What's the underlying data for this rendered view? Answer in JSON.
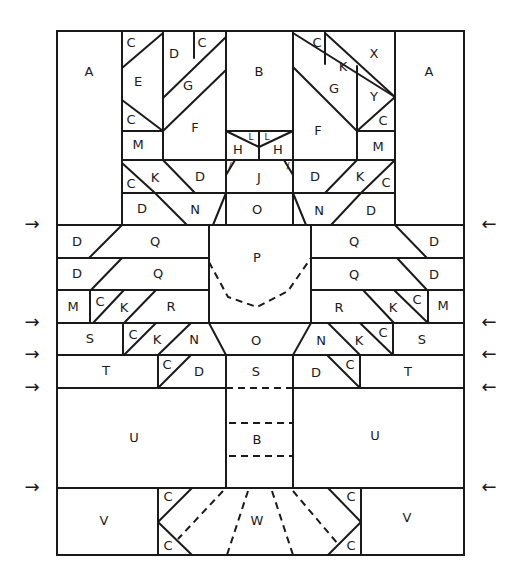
{
  "diagram": {
    "type": "quilt-block-piecing-diagram",
    "stroke_color": "#1a1a1a",
    "background": "#ffffff",
    "labels": [
      {
        "id": "A-left",
        "text": "A",
        "x": 89,
        "y": 72
      },
      {
        "id": "A-right",
        "text": "A",
        "x": 429,
        "y": 72
      },
      {
        "id": "B-top",
        "text": "B",
        "x": 259,
        "y": 72
      },
      {
        "id": "C1",
        "text": "C",
        "x": 131,
        "y": 43
      },
      {
        "id": "D1",
        "text": "D",
        "x": 174,
        "y": 54
      },
      {
        "id": "C2",
        "text": "C",
        "x": 202,
        "y": 43
      },
      {
        "id": "E",
        "text": "E",
        "x": 138,
        "y": 82
      },
      {
        "id": "G-left",
        "text": "G",
        "x": 188,
        "y": 86
      },
      {
        "id": "C3",
        "text": "C",
        "x": 131,
        "y": 120
      },
      {
        "id": "F-left",
        "text": "F",
        "x": 195,
        "y": 128
      },
      {
        "id": "M-left-top",
        "text": "M",
        "x": 138,
        "y": 145
      },
      {
        "id": "C4",
        "text": "C",
        "x": 131,
        "y": 184
      },
      {
        "id": "K1",
        "text": "K",
        "x": 155,
        "y": 178
      },
      {
        "id": "D2",
        "text": "D",
        "x": 200,
        "y": 177
      },
      {
        "id": "D3",
        "text": "D",
        "x": 142,
        "y": 209
      },
      {
        "id": "N1",
        "text": "N",
        "x": 195,
        "y": 210
      },
      {
        "id": "C5",
        "text": "C",
        "x": 317,
        "y": 43
      },
      {
        "id": "X",
        "text": "X",
        "x": 374,
        "y": 54
      },
      {
        "id": "K2",
        "text": "K",
        "x": 343,
        "y": 67
      },
      {
        "id": "G-right",
        "text": "G",
        "x": 334,
        "y": 89
      },
      {
        "id": "Y",
        "text": "Y",
        "x": 374,
        "y": 97
      },
      {
        "id": "C6",
        "text": "C",
        "x": 383,
        "y": 121
      },
      {
        "id": "F-right",
        "text": "F",
        "x": 318,
        "y": 131
      },
      {
        "id": "M-right-top",
        "text": "M",
        "x": 378,
        "y": 147
      },
      {
        "id": "D4",
        "text": "D",
        "x": 315,
        "y": 177
      },
      {
        "id": "K3",
        "text": "K",
        "x": 360,
        "y": 177
      },
      {
        "id": "C7",
        "text": "C",
        "x": 386,
        "y": 183
      },
      {
        "id": "N2",
        "text": "N",
        "x": 319,
        "y": 211
      },
      {
        "id": "D5",
        "text": "D",
        "x": 371,
        "y": 211
      },
      {
        "id": "H-left",
        "text": "H",
        "x": 238,
        "y": 150
      },
      {
        "id": "H-right",
        "text": "H",
        "x": 278,
        "y": 150
      },
      {
        "id": "L-left",
        "text": "L",
        "x": 251,
        "y": 137
      },
      {
        "id": "L-right",
        "text": "L",
        "x": 267,
        "y": 137
      },
      {
        "id": "J",
        "text": "J",
        "x": 259,
        "y": 178
      },
      {
        "id": "O-top",
        "text": "O",
        "x": 257,
        "y": 210
      },
      {
        "id": "D6",
        "text": "D",
        "x": 77,
        "y": 242
      },
      {
        "id": "Q1",
        "text": "Q",
        "x": 155,
        "y": 242
      },
      {
        "id": "P",
        "text": "P",
        "x": 257,
        "y": 258
      },
      {
        "id": "Q2",
        "text": "Q",
        "x": 354,
        "y": 242
      },
      {
        "id": "D7",
        "text": "D",
        "x": 434,
        "y": 242
      },
      {
        "id": "D8",
        "text": "D",
        "x": 77,
        "y": 274
      },
      {
        "id": "Q3",
        "text": "Q",
        "x": 158,
        "y": 274
      },
      {
        "id": "Q4",
        "text": "Q",
        "x": 354,
        "y": 275
      },
      {
        "id": "D9",
        "text": "D",
        "x": 434,
        "y": 275
      },
      {
        "id": "M-left-mid",
        "text": "M",
        "x": 73,
        "y": 307
      },
      {
        "id": "C8",
        "text": "C",
        "x": 100,
        "y": 302
      },
      {
        "id": "K4",
        "text": "K",
        "x": 124,
        "y": 308
      },
      {
        "id": "R-left",
        "text": "R",
        "x": 171,
        "y": 307
      },
      {
        "id": "R-right",
        "text": "R",
        "x": 339,
        "y": 308
      },
      {
        "id": "K5",
        "text": "K",
        "x": 393,
        "y": 308
      },
      {
        "id": "C9",
        "text": "C",
        "x": 417,
        "y": 300
      },
      {
        "id": "M-right-mid",
        "text": "M",
        "x": 443,
        "y": 306
      },
      {
        "id": "S-left",
        "text": "S",
        "x": 90,
        "y": 339
      },
      {
        "id": "C10",
        "text": "C",
        "x": 133,
        "y": 335
      },
      {
        "id": "K6",
        "text": "K",
        "x": 157,
        "y": 340
      },
      {
        "id": "N3",
        "text": "N",
        "x": 194,
        "y": 340
      },
      {
        "id": "O-mid",
        "text": "O",
        "x": 256,
        "y": 341
      },
      {
        "id": "N4",
        "text": "N",
        "x": 321,
        "y": 341
      },
      {
        "id": "K7",
        "text": "K",
        "x": 359,
        "y": 341
      },
      {
        "id": "C11",
        "text": "C",
        "x": 383,
        "y": 333
      },
      {
        "id": "S-right",
        "text": "S",
        "x": 422,
        "y": 340
      },
      {
        "id": "T-left",
        "text": "T",
        "x": 106,
        "y": 371
      },
      {
        "id": "C12",
        "text": "C",
        "x": 167,
        "y": 365
      },
      {
        "id": "D10",
        "text": "D",
        "x": 199,
        "y": 372
      },
      {
        "id": "S-mid",
        "text": "S",
        "x": 256,
        "y": 372
      },
      {
        "id": "D11",
        "text": "D",
        "x": 316,
        "y": 373
      },
      {
        "id": "C13",
        "text": "C",
        "x": 350,
        "y": 365
      },
      {
        "id": "T-right",
        "text": "T",
        "x": 408,
        "y": 372
      },
      {
        "id": "U-left",
        "text": "U",
        "x": 134,
        "y": 438
      },
      {
        "id": "B-mid",
        "text": "B",
        "x": 257,
        "y": 440
      },
      {
        "id": "U-right",
        "text": "U",
        "x": 375,
        "y": 436
      },
      {
        "id": "V-left",
        "text": "V",
        "x": 104,
        "y": 521
      },
      {
        "id": "C14",
        "text": "C",
        "x": 168,
        "y": 497
      },
      {
        "id": "C15",
        "text": "C",
        "x": 168,
        "y": 546
      },
      {
        "id": "W",
        "text": "W",
        "x": 257,
        "y": 521
      },
      {
        "id": "C16",
        "text": "C",
        "x": 351,
        "y": 497
      },
      {
        "id": "C17",
        "text": "C",
        "x": 351,
        "y": 546
      },
      {
        "id": "V-right",
        "text": "V",
        "x": 407,
        "y": 518
      }
    ],
    "arrows": {
      "left": [
        {
          "symbol": "→",
          "y": 225
        },
        {
          "symbol": "→",
          "y": 323
        },
        {
          "symbol": "→",
          "y": 355
        },
        {
          "symbol": "→",
          "y": 388
        },
        {
          "symbol": "→",
          "y": 488
        }
      ],
      "right": [
        {
          "symbol": "←",
          "y": 225
        },
        {
          "symbol": "←",
          "y": 323
        },
        {
          "symbol": "←",
          "y": 355
        },
        {
          "symbol": "←",
          "y": 388
        },
        {
          "symbol": "←",
          "y": 488
        }
      ]
    }
  }
}
